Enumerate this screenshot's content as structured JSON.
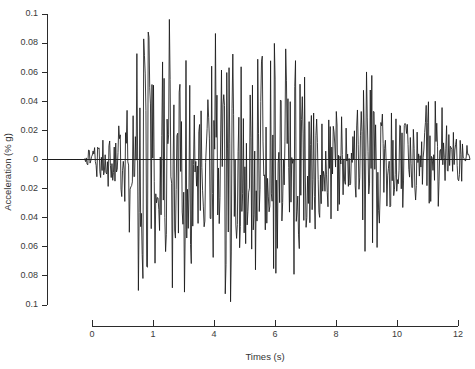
{
  "chart_data": {
    "type": "line",
    "title": "",
    "subtitle": "",
    "xlabel": "Times (s)",
    "ylabel": "Acceleration (% g)",
    "grid": false,
    "legend": null,
    "xlim": [
      0,
      12
    ],
    "ylim": [
      -0.1,
      0.1
    ],
    "x_tick_labels": [
      "0",
      "1",
      "4",
      "6",
      "8",
      "10",
      "12"
    ],
    "x_tick_values": [
      0,
      1,
      4,
      6,
      8,
      10,
      12
    ],
    "y_tick_labels": [
      "0.1",
      "0.08",
      "0.06",
      "0.04",
      "0.02",
      "0",
      "0.02",
      "0.04",
      "0.06",
      "0.08",
      "0.1"
    ],
    "y_tick_values": [
      0.1,
      0.08,
      0.06,
      0.04,
      0.02,
      0,
      -0.02,
      -0.04,
      -0.06,
      -0.08,
      -0.1
    ],
    "series": [
      {
        "name": "acceleration-time-history",
        "description": "Earthquake accelerogram: quiet onset, strong motion phase, gradual decay",
        "x_unit": "s",
        "y_unit": "% g",
        "sample_count": 560,
        "duration_s": 12,
        "peak_positive": 0.1,
        "peak_negative": -0.1,
        "envelope_control_points": [
          {
            "t": 0.0,
            "amp": 0.0
          },
          {
            "t": 1.05,
            "amp": 0.0
          },
          {
            "t": 1.25,
            "amp": 0.012
          },
          {
            "t": 1.6,
            "amp": 0.02
          },
          {
            "t": 1.95,
            "amp": 0.022
          },
          {
            "t": 2.25,
            "amp": 0.048
          },
          {
            "t": 2.55,
            "amp": 0.094
          },
          {
            "t": 2.9,
            "amp": 0.1
          },
          {
            "t": 3.6,
            "amp": 0.098
          },
          {
            "t": 4.3,
            "amp": 0.082
          },
          {
            "t": 4.9,
            "amp": 0.1
          },
          {
            "t": 5.6,
            "amp": 0.095
          },
          {
            "t": 6.2,
            "amp": 0.1
          },
          {
            "t": 6.8,
            "amp": 0.096
          },
          {
            "t": 7.3,
            "amp": 0.07
          },
          {
            "t": 7.8,
            "amp": 0.05
          },
          {
            "t": 8.3,
            "amp": 0.042
          },
          {
            "t": 8.7,
            "amp": 0.034
          },
          {
            "t": 9.2,
            "amp": 0.09
          },
          {
            "t": 9.6,
            "amp": 0.044
          },
          {
            "t": 10.1,
            "amp": 0.036
          },
          {
            "t": 10.5,
            "amp": 0.032
          },
          {
            "t": 10.9,
            "amp": 0.062
          },
          {
            "t": 11.3,
            "amp": 0.03
          },
          {
            "t": 11.7,
            "amp": 0.022
          },
          {
            "t": 11.95,
            "amp": 0.012
          },
          {
            "t": 12.0,
            "amp": 0.0
          }
        ]
      }
    ],
    "colors": {
      "trace": "#1a1a1a",
      "axis": "#2b2b2b",
      "background": "#ffffff",
      "text": "#3a3a3a"
    }
  }
}
